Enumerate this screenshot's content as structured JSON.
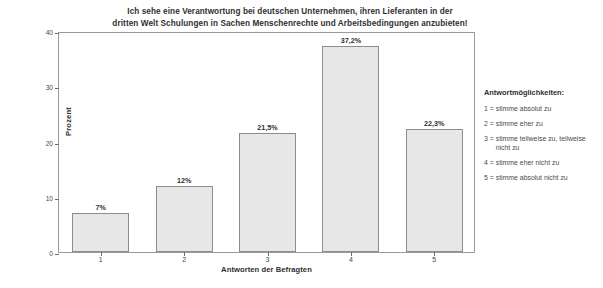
{
  "chart_data": {
    "type": "bar",
    "title": "Ich sehe eine Verantwortung bei deutschen Unternehmen, ihren Lieferanten in der dritten Welt Schulungen in Sachen Menschenrechte und Arbeitsbedingungen anzubieten!",
    "title_line1": "Ich sehe eine Verantwortung bei deutschen Unternehmen, ihren Lieferanten in der",
    "title_line2": "dritten Welt Schulungen in Sachen Menschenrechte und Arbeitsbedingungen anzubieten!",
    "xlabel": "Antworten der Befragten",
    "ylabel": "Prozent",
    "categories": [
      "1",
      "2",
      "3",
      "4",
      "5"
    ],
    "values": [
      7,
      12,
      21.5,
      37.2,
      22.3
    ],
    "value_labels": [
      "7%",
      "12%",
      "21,5%",
      "37,2%",
      "22,3%"
    ],
    "ylim": [
      0,
      40
    ],
    "yticks": [
      0,
      10,
      20,
      30,
      40
    ],
    "ytick_labels": [
      "0",
      "10",
      "20",
      "30",
      "40"
    ],
    "grid": false,
    "legend_position": "right-outside",
    "bar_color": "#e7e7e7",
    "bar_border_color": "#8d8d8d",
    "frame_color": "#9a9a9a"
  },
  "legend": {
    "title": "Antwortmöglichkeiten:",
    "items": [
      {
        "key": "1 = ",
        "text": "stimme absolut zu"
      },
      {
        "key": "2 = ",
        "text": "stimme eher zu"
      },
      {
        "key": "3 = ",
        "text": "stimme teilweise zu, teilweise nicht zu"
      },
      {
        "key": "4 = ",
        "text": "stimme eher nicht zu"
      },
      {
        "key": "5 = ",
        "text": "stimme absolut nicht zu"
      }
    ]
  }
}
